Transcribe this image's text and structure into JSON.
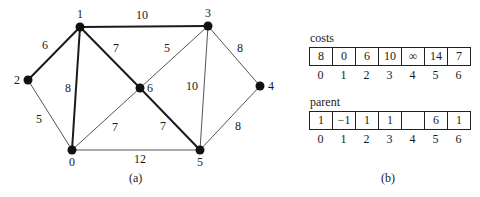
{
  "figure_a": {
    "caption": "(a)",
    "nodes": [
      {
        "id": "0",
        "label": "0",
        "x": 72,
        "y": 150,
        "label_dx": 0,
        "label_dy": 16,
        "anchor": "middle"
      },
      {
        "id": "1",
        "label": "1",
        "x": 80,
        "y": 27,
        "label_dx": 0,
        "label_dy": -9,
        "anchor": "middle"
      },
      {
        "id": "2",
        "label": "2",
        "x": 28,
        "y": 80,
        "label_dx": -11,
        "label_dy": 4,
        "anchor": "middle"
      },
      {
        "id": "3",
        "label": "3",
        "x": 208,
        "y": 26,
        "label_dx": 0,
        "label_dy": -9,
        "anchor": "middle"
      },
      {
        "id": "4",
        "label": "4",
        "x": 260,
        "y": 86,
        "label_dx": 11,
        "label_dy": 4,
        "anchor": "middle"
      },
      {
        "id": "5",
        "label": "5",
        "x": 200,
        "y": 150,
        "label_dx": 0,
        "label_dy": 16,
        "anchor": "middle"
      },
      {
        "id": "6",
        "label": "6",
        "x": 140,
        "y": 88,
        "label_dx": 10,
        "label_dy": 4,
        "anchor": "middle"
      }
    ],
    "edges": [
      {
        "from": "1",
        "to": "2",
        "weight": "6",
        "bold": true,
        "lx": 45,
        "ly": 49
      },
      {
        "from": "1",
        "to": "3",
        "weight": "10",
        "bold": true,
        "lx": 142,
        "ly": 19
      },
      {
        "from": "1",
        "to": "0",
        "weight": "8",
        "bold": true,
        "lx": 68,
        "ly": 92
      },
      {
        "from": "1",
        "to": "6",
        "weight": "7",
        "bold": true,
        "lx": 116,
        "ly": 52
      },
      {
        "from": "6",
        "to": "5",
        "weight": "7",
        "bold": true,
        "lx": 163,
        "ly": 130
      },
      {
        "from": "2",
        "to": "0",
        "weight": "5",
        "bold": false,
        "lx": 39,
        "ly": 123
      },
      {
        "from": "0",
        "to": "6",
        "weight": "7",
        "bold": false,
        "lx": 115,
        "ly": 131
      },
      {
        "from": "0",
        "to": "5",
        "weight": "12",
        "bold": false,
        "lx": 140,
        "ly": 163
      },
      {
        "from": "6",
        "to": "3",
        "weight": "5",
        "bold": false,
        "lx": 167,
        "ly": 52
      },
      {
        "from": "3",
        "to": "5",
        "weight": "10",
        "bold": false,
        "lx": 192,
        "ly": 90
      },
      {
        "from": "3",
        "to": "4",
        "weight": "8",
        "bold": false,
        "lx": 240,
        "ly": 52
      },
      {
        "from": "4",
        "to": "5",
        "weight": "8",
        "bold": false,
        "lx": 238,
        "ly": 130
      }
    ],
    "colors": {
      "node": "#111111",
      "bold_edge": "#1a1a1a",
      "thin_edge": "#555555"
    }
  },
  "figure_b": {
    "caption": "(b)",
    "costs": {
      "label": "costs",
      "values": [
        "8",
        "0",
        "6",
        "10",
        "∞",
        "14",
        "7"
      ],
      "indices": [
        "0",
        "1",
        "2",
        "3",
        "4",
        "5",
        "6"
      ]
    },
    "parent": {
      "label": "parent",
      "values": [
        "1",
        "−1",
        "1",
        "1",
        "",
        "6",
        "1"
      ],
      "indices": [
        "0",
        "1",
        "2",
        "3",
        "4",
        "5",
        "6"
      ]
    }
  }
}
